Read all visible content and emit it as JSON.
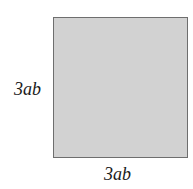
{
  "diagram": {
    "shape": "square",
    "fill_color": "#d2d2d2",
    "border_color": "#6e6e6e",
    "labels": {
      "left_side": "3ab",
      "bottom_side": "3ab"
    }
  }
}
